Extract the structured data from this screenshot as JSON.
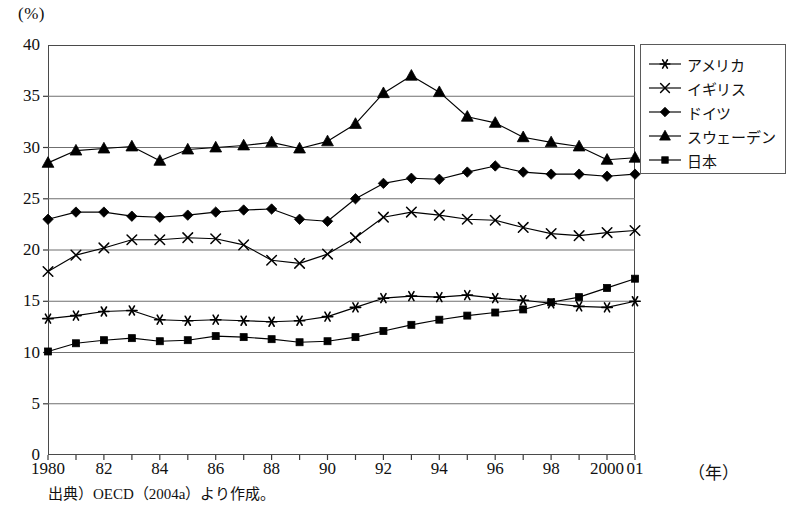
{
  "chart_data": {
    "type": "line",
    "title": "",
    "xlabel": "(年)",
    "ylabel": "(%)",
    "unit_label": "(%)",
    "x": [
      1980,
      1981,
      1982,
      1983,
      1984,
      1985,
      1986,
      1987,
      1988,
      1989,
      1990,
      1991,
      1992,
      1993,
      1994,
      1995,
      1996,
      1997,
      1998,
      1999,
      2000,
      2001
    ],
    "xtick_labels": [
      "1980",
      "",
      "82",
      "",
      "84",
      "",
      "86",
      "",
      "88",
      "",
      "90",
      "",
      "92",
      "",
      "94",
      "",
      "96",
      "",
      "98",
      "",
      "2000",
      "01"
    ],
    "xlim": [
      1980,
      2001
    ],
    "ylim": [
      0,
      40
    ],
    "yticks": [
      0,
      5,
      10,
      15,
      20,
      25,
      30,
      35,
      40
    ],
    "ytick_labels": [
      "0",
      "5",
      "10",
      "15",
      "20",
      "25",
      "30",
      "35",
      "40"
    ],
    "grid": "horizontal",
    "legend_position": "outside-right-top",
    "series": [
      {
        "name": "アメリカ",
        "marker": "asterisk",
        "color": "#000000",
        "values": [
          13.3,
          13.6,
          14.0,
          14.1,
          13.2,
          13.1,
          13.2,
          13.1,
          13.0,
          13.1,
          13.5,
          14.4,
          15.3,
          15.5,
          15.4,
          15.6,
          15.3,
          15.1,
          14.8,
          14.5,
          14.4,
          15.0
        ]
      },
      {
        "name": "イギリス",
        "marker": "x",
        "color": "#000000",
        "values": [
          17.9,
          19.5,
          20.2,
          21.0,
          21.0,
          21.2,
          21.1,
          20.5,
          19.0,
          18.7,
          19.6,
          21.2,
          23.2,
          23.7,
          23.4,
          23.0,
          22.9,
          22.2,
          21.6,
          21.4,
          21.7,
          21.9
        ]
      },
      {
        "name": "ドイツ",
        "marker": "diamond",
        "color": "#000000",
        "values": [
          23.0,
          23.7,
          23.7,
          23.3,
          23.2,
          23.4,
          23.7,
          23.9,
          24.0,
          23.0,
          22.8,
          25.0,
          26.5,
          27.0,
          26.9,
          27.6,
          28.2,
          27.6,
          27.4,
          27.4,
          27.2,
          27.4
        ]
      },
      {
        "name": "スウェーデン",
        "marker": "triangle",
        "color": "#000000",
        "values": [
          28.5,
          29.7,
          29.9,
          30.1,
          28.7,
          29.8,
          30.0,
          30.2,
          30.5,
          29.9,
          30.6,
          32.3,
          35.3,
          37.0,
          35.4,
          33.0,
          32.4,
          31.0,
          30.5,
          30.1,
          28.8,
          29.0
        ]
      },
      {
        "name": "日本",
        "marker": "square",
        "color": "#000000",
        "values": [
          10.1,
          10.9,
          11.2,
          11.4,
          11.1,
          11.2,
          11.6,
          11.5,
          11.3,
          11.0,
          11.1,
          11.5,
          12.1,
          12.7,
          13.2,
          13.6,
          13.9,
          14.2,
          14.9,
          15.4,
          16.3,
          17.2
        ]
      }
    ],
    "source_note": "出典）OECD（2004a）より作成。"
  },
  "legend": {
    "items": [
      {
        "label": "アメリカ",
        "marker": "asterisk"
      },
      {
        "label": "イギリス",
        "marker": "x"
      },
      {
        "label": "ドイツ",
        "marker": "diamond"
      },
      {
        "label": "スウェーデン",
        "marker": "triangle"
      },
      {
        "label": "日本",
        "marker": "square"
      }
    ]
  },
  "axes": {
    "unit": "(%)",
    "year_unit": "（年）"
  }
}
